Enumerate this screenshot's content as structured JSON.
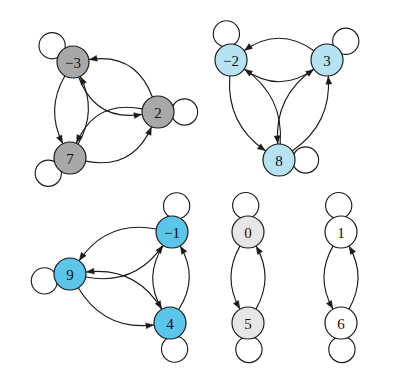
{
  "figure": {
    "background_color": "#ffffff",
    "edge_color": "#1b1b1b",
    "node_stroke_color": "#1b1b1b",
    "label_color": "#111111",
    "width": 393,
    "height": 384
  },
  "palette": {
    "gray_fill": "#a8a8a8",
    "pale_blue_fill": "#b6e2f2",
    "bright_blue_fill": "#5bc5ea",
    "light_gray_fill": "#e6e6e6",
    "white_fill": "#ffffff"
  },
  "components": [
    {
      "id": "component-1",
      "name": "gray-triangle-component",
      "fill": "#a8a8a8",
      "node_radius": 16,
      "nodes": [
        {
          "id": "n-3",
          "label": "−3",
          "cx": 73,
          "cy": 62,
          "loop_angle": 142
        },
        {
          "id": "n2",
          "label": "2",
          "cx": 158,
          "cy": 112,
          "loop_angle": 0
        },
        {
          "id": "n7",
          "label": "7",
          "cx": 70,
          "cy": 158,
          "loop_angle": 215
        }
      ],
      "edges": [
        {
          "from": "n-3",
          "to": "n2",
          "bow": 20
        },
        {
          "from": "n2",
          "to": "n-3",
          "bow": 20
        },
        {
          "from": "n-3",
          "to": "n7",
          "bow": 13
        },
        {
          "from": "n7",
          "to": "n-3",
          "bow": 13
        },
        {
          "from": "n2",
          "to": "n7",
          "bow": 20
        },
        {
          "from": "n7",
          "to": "n2",
          "bow": 20
        }
      ]
    },
    {
      "id": "component-2",
      "name": "pale-blue-triangle-component",
      "fill": "#b6e2f2",
      "node_radius": 16,
      "nodes": [
        {
          "id": "n-2",
          "label": "−2",
          "cx": 231,
          "cy": 60,
          "loop_angle": 100
        },
        {
          "id": "n3",
          "label": "3",
          "cx": 327,
          "cy": 60,
          "loop_angle": 45
        },
        {
          "id": "n8",
          "label": "8",
          "cx": 279,
          "cy": 160,
          "loop_angle": 0
        }
      ],
      "edges": [
        {
          "from": "n-2",
          "to": "n3",
          "bow": 17
        },
        {
          "from": "n3",
          "to": "n-2",
          "bow": 17
        },
        {
          "from": "n-2",
          "to": "n8",
          "bow": 16
        },
        {
          "from": "n8",
          "to": "n-2",
          "bow": 16
        },
        {
          "from": "n3",
          "to": "n8",
          "bow": 16
        },
        {
          "from": "n8",
          "to": "n3",
          "bow": 16
        }
      ]
    },
    {
      "id": "component-3",
      "name": "bright-blue-triangle-component",
      "fill": "#5bc5ea",
      "node_radius": 16,
      "nodes": [
        {
          "id": "n-1",
          "label": "−1",
          "cx": 172,
          "cy": 232,
          "loop_angle": 80
        },
        {
          "id": "n9",
          "label": "9",
          "cx": 70,
          "cy": 274,
          "loop_angle": 195
        },
        {
          "id": "n4",
          "label": "4",
          "cx": 170,
          "cy": 323,
          "loop_angle": 280
        }
      ],
      "edges": [
        {
          "from": "n9",
          "to": "n-1",
          "bow": 18
        },
        {
          "from": "n-1",
          "to": "n9",
          "bow": 18
        },
        {
          "from": "n-1",
          "to": "n4",
          "bow": 14
        },
        {
          "from": "n4",
          "to": "n-1",
          "bow": 14
        },
        {
          "from": "n9",
          "to": "n4",
          "bow": 18
        },
        {
          "from": "n4",
          "to": "n9",
          "bow": 18
        }
      ]
    },
    {
      "id": "component-4",
      "name": "light-gray-pair-component",
      "fill": "#e6e6e6",
      "node_radius": 16,
      "nodes": [
        {
          "id": "n0",
          "label": "0",
          "cx": 248,
          "cy": 232,
          "loop_angle": 95
        },
        {
          "id": "n5",
          "label": "5",
          "cx": 248,
          "cy": 323,
          "loop_angle": 272
        }
      ],
      "edges": [
        {
          "from": "n0",
          "to": "n5",
          "bow": 13
        },
        {
          "from": "n5",
          "to": "n0",
          "bow": 13
        }
      ]
    },
    {
      "id": "component-5",
      "name": "white-pair-component",
      "fill": "#ffffff",
      "node_radius": 16,
      "nodes": [
        {
          "id": "n1",
          "label": "1",
          "cx": 341,
          "cy": 232,
          "loop_angle": 95
        },
        {
          "id": "n6",
          "label": "6",
          "cx": 341,
          "cy": 323,
          "loop_angle": 272
        }
      ],
      "edges": [
        {
          "from": "n1",
          "to": "n6",
          "bow": 13
        },
        {
          "from": "n6",
          "to": "n1",
          "bow": 13
        }
      ]
    }
  ]
}
